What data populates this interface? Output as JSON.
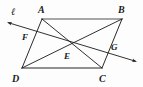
{
  "figure": {
    "type": "geometry-diagram",
    "shape": "parallelogram",
    "background_color": "#fdfdfd",
    "stroke_color": "#1a1a1a",
    "edge_top_color": "#8a8a8a",
    "edge_bottom_color": "#6e6e6e"
  },
  "labels": {
    "line_l": "ℓ",
    "vertex_a": "A",
    "vertex_b": "B",
    "vertex_c": "C",
    "vertex_d": "D",
    "point_e": "E",
    "point_f": "F",
    "point_g": "G"
  },
  "geometry": {
    "vertices": {
      "A": {
        "x": 42,
        "y": 19
      },
      "B": {
        "x": 122,
        "y": 19
      },
      "C": {
        "x": 102,
        "y": 68
      },
      "D": {
        "x": 22,
        "y": 68
      }
    },
    "points": {
      "E": {
        "x": 72,
        "y": 43.5
      },
      "F": {
        "x": 33,
        "y": 31
      },
      "G": {
        "x": 108,
        "y": 54
      }
    },
    "transversal": {
      "name": "ℓ",
      "start": {
        "x": 6,
        "y": 22
      },
      "end": {
        "x": 138,
        "y": 62
      },
      "arrow_start": true,
      "arrow_end": true
    },
    "segments": [
      {
        "name": "AB",
        "from": "A",
        "to": "B"
      },
      {
        "name": "BC",
        "from": "B",
        "to": "C"
      },
      {
        "name": "CD",
        "from": "C",
        "to": "D"
      },
      {
        "name": "DA",
        "from": "D",
        "to": "A"
      },
      {
        "name": "AC",
        "from": "A",
        "to": "C"
      },
      {
        "name": "BD",
        "from": "B",
        "to": "D"
      }
    ]
  },
  "label_positions": {
    "line_l": {
      "x": 11,
      "y": 15
    },
    "A": {
      "x": 38,
      "y": 13
    },
    "B": {
      "x": 119,
      "y": 13
    },
    "C": {
      "x": 100,
      "y": 81
    },
    "D": {
      "x": 13,
      "y": 81
    },
    "E": {
      "x": 65,
      "y": 59
    },
    "F": {
      "x": 23,
      "y": 40
    },
    "G": {
      "x": 112,
      "y": 50
    }
  }
}
